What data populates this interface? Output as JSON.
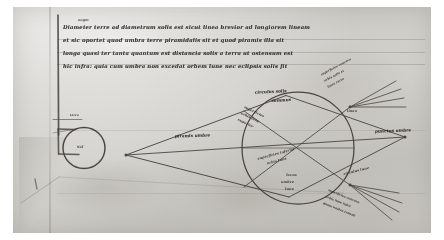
{
  "document": {
    "kind": "medieval-manuscript-leaf",
    "script": "gothic-textualis-abbreviated-latin",
    "ink_color": "#2b2620",
    "parchment_color": "#d2cfc6"
  },
  "text_block": {
    "gloss": "augm",
    "lines": [
      "Diameter terre ad diametrum solis est sicut linea brevior ad longiorem lineam",
      "et sic oportet quod umbra terre piramidalis sit et quod piramis illa sit",
      "longa quasi ter tanta quantum est distancia solis a terra ut ostensum est",
      "hic infra: quia cum umbra non excedat orbem lune nec eclipsis solis fit"
    ]
  },
  "diagram": {
    "sun_circle": {
      "label": "Sol"
    },
    "sun_tick_label": "terra",
    "axis_label": "piramis umbre",
    "apex_label": "punctus umbre",
    "big_circle": {
      "top_labels": [
        "circulus solis",
        "summus"
      ],
      "upper_inner": [
        "superficies",
        "orbis lune",
        "superior"
      ],
      "lower_inner": [
        "superficies inferior",
        "orbis lune"
      ],
      "center_caption": [
        "locus",
        "umbre",
        "lune"
      ]
    },
    "upper_right_rays": [
      "superficies concava",
      "orbis solis et",
      "linea recta"
    ],
    "upper_right_node": "linea",
    "lower_right_node": "circulus lune",
    "lower_right_rays": [
      "superficies concava",
      "orbis lune infra",
      "quam umbra transit"
    ]
  }
}
